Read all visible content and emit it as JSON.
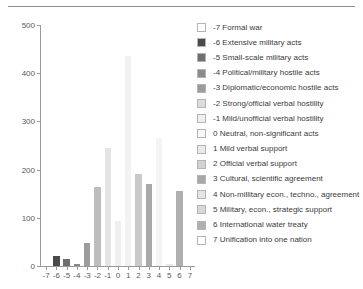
{
  "chart_data": {
    "type": "bar",
    "title": "",
    "xlabel": "",
    "ylabel": "",
    "ylim": [
      0,
      500
    ],
    "yticks": [
      0,
      100,
      200,
      300,
      400,
      500
    ],
    "grid": false,
    "legend_position": "right",
    "categories": [
      "-7",
      "-6",
      "-5",
      "-4",
      "-3",
      "-2",
      "-1",
      "0",
      "1",
      "2",
      "3",
      "4",
      "5",
      "6",
      "7"
    ],
    "values": [
      0,
      20,
      15,
      4,
      48,
      163,
      245,
      93,
      435,
      190,
      170,
      265,
      5,
      155,
      0
    ],
    "bar_colors": [
      "#ffffff",
      "#4a4a4a",
      "#6e6e6e",
      "#8a8a8a",
      "#9c9c9c",
      "#bdbdbd",
      "#e4e4e4",
      "#efefef",
      "#f2f2f2",
      "#c9c9c9",
      "#a8a8a8",
      "#f4f4f4",
      "#e8e8e8",
      "#b0b0b0",
      "#ffffff"
    ],
    "legend": [
      {
        "key": "-7",
        "label": "-7 Formal war",
        "color": "#ffffff"
      },
      {
        "key": "-6",
        "label": "-6 Extensive military acts",
        "color": "#4a4a4a"
      },
      {
        "key": "-5",
        "label": "-5 Small-scale military acts",
        "color": "#6e6e6e"
      },
      {
        "key": "-4",
        "label": "-4 Political/military hostile acts",
        "color": "#8a8a8a"
      },
      {
        "key": "-3",
        "label": "-3 Diplomatic/economic hostile acts",
        "color": "#9c9c9c"
      },
      {
        "key": "-2",
        "label": "-2 Strong/official verbal hostility",
        "color": "#dcdcdc"
      },
      {
        "key": "-1",
        "label": "-1 Mild/unofficial verbal hostility",
        "color": "#efefef"
      },
      {
        "key": "0",
        "label": "0 Neutral, non-significant acts",
        "color": "#f7f7f7"
      },
      {
        "key": "1",
        "label": "1 Mild verbal support",
        "color": "#e9e9e9"
      },
      {
        "key": "2",
        "label": "2 Official verbal support",
        "color": "#d2d2d2"
      },
      {
        "key": "3",
        "label": "3 Cultural, scientific agreement",
        "color": "#a8a8a8"
      },
      {
        "key": "4",
        "label": "4 Non-millitary econ., techno., agreement",
        "color": "#e4e4e4"
      },
      {
        "key": "5",
        "label": "5 Military, econ., strategic support",
        "color": "#d8d8d8"
      },
      {
        "key": "6",
        "label": "6 International water treaty",
        "color": "#b0b0b0"
      },
      {
        "key": "7",
        "label": "7 Unification into one nation",
        "color": "#ffffff"
      }
    ]
  }
}
